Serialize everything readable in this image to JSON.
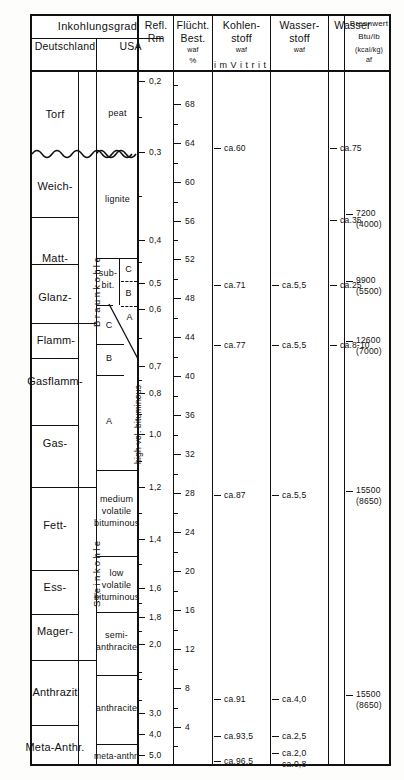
{
  "header": {
    "group_left": "Inkohlungsgrad",
    "col_germany": "Deutschland",
    "col_usa": "USA",
    "col_refl_l1": "Refl.",
    "col_refl_l2": "Rm",
    "col_vol_l1": "Flücht.",
    "col_vol_l2": "Best.",
    "col_vol_l3": "waf",
    "col_vol_l4": "%",
    "col_carbon_l1": "Kohlen-",
    "col_carbon_l2": "stoff",
    "col_carbon_l3": "waf",
    "col_hydrogen_l1": "Wasser-",
    "col_hydrogen_l2": "stoff",
    "col_hydrogen_l3": "waf",
    "col_water": "Wasser",
    "col_heat_l1": "Brennwert",
    "col_heat_l2": "Btu/lb",
    "col_heat_l3": "(kcal/kg)",
    "col_heat_l4": "af",
    "vitrit_note": "i m    V i t r i t"
  },
  "chart_data": {
    "type": "table",
    "german_ranks": [
      "Torf",
      "Weich-",
      "Matt-",
      "Glanz-",
      "Flamm-",
      "Gasflamm-",
      "Gas-",
      "Fett-",
      "Ess-",
      "Mager-",
      "Anthrazit",
      "Meta-Anthr."
    ],
    "german_groups": [
      "Braunkohle",
      "Steinkohle"
    ],
    "usa_ranks": [
      "peat",
      "lignite",
      "sub-bit.",
      "high vol. bituminous",
      "medium volatile bituminous",
      "low volatile bituminous",
      "semi-anthracite",
      "anthracite",
      "meta-anthr."
    ],
    "usa_subranks_subbit": [
      "C",
      "B",
      "A"
    ],
    "usa_subranks_hvb": [
      "C",
      "B",
      "A"
    ],
    "reflectance_label": "Refl. Rm",
    "reflectance_ticks": [
      "0,2",
      "0,3",
      "0,4",
      "0,5",
      "0,6",
      "0,7",
      "0,8",
      "1,0",
      "1,2",
      "1,4",
      "1,6",
      "1,8",
      "2,0",
      "3,0",
      "4,0",
      "5,0"
    ],
    "volatile_label": "Flücht. Best. waf %",
    "volatile_ticks": [
      "68",
      "64",
      "60",
      "56",
      "52",
      "48",
      "44",
      "40",
      "36",
      "32",
      "28",
      "24",
      "20",
      "16",
      "12",
      "8",
      "4"
    ],
    "carbon_values": [
      "ca.60",
      "ca.71",
      "ca.77",
      "ca.87",
      "ca.91",
      "ca.93,5",
      "ca.96,5"
    ],
    "hydrogen_values": [
      "ca.5,5",
      "ca.5,5",
      "ca.5,5",
      "ca.4,0",
      "ca.2,5",
      "ca.2,0",
      "ca.0,8"
    ],
    "water_values": [
      "ca.75",
      "ca.35",
      "ca.25",
      "ca.8-10"
    ],
    "heat_values": [
      "7200",
      "(4000)",
      "9900",
      "(5500)",
      "12600",
      "(7000)",
      "15500",
      "(8650)",
      "15500",
      "(8650)"
    ]
  },
  "german": {
    "r0": "Torf",
    "r1": "Weich-",
    "r2": "Matt-",
    "r3": "Glanz-",
    "r4": "Flamm-",
    "r5": "Gasflamm-",
    "r6": "Gas-",
    "r7": "Fett-",
    "r8": "Ess-",
    "r9": "Mager-",
    "r10": "Anthrazit",
    "r11": "Meta-Anthr.",
    "group_brown": "Braunkohle",
    "group_hard": "Steinkohle"
  },
  "usa": {
    "peat": "peat",
    "lignite": "lignite",
    "subbit_l1": "sub-",
    "subbit_l2": "bit.",
    "subbit_c": "C",
    "subbit_b": "B",
    "subbit_a": "A",
    "hvb_c": "C",
    "hvb_b": "B",
    "hvb_a": "A",
    "hvb_label": "high vol. bituminous",
    "mvb_l1": "medium",
    "mvb_l2": "volatile",
    "mvb_l3": "bituminous",
    "lvb_l1": "low",
    "lvb_l2": "volatile",
    "lvb_l3": "bituminous",
    "semi_l1": "semi-",
    "semi_l2": "anthracite",
    "anthracite": "anthracite",
    "meta": "meta-anthr."
  },
  "refl_scale": [
    {
      "label": "0,2",
      "y": 81
    },
    {
      "label": "0,3",
      "y": 152
    },
    {
      "label": "0,4",
      "y": 240
    },
    {
      "label": "0,5",
      "y": 283
    },
    {
      "label": "0,6",
      "y": 309
    },
    {
      "label": "0,7",
      "y": 366
    },
    {
      "label": "0,8",
      "y": 393
    }
  ],
  "refl_scale2": [
    {
      "label": "1,0",
      "y": 434
    },
    {
      "label": "1,2",
      "y": 487
    },
    {
      "label": "1,4",
      "y": 539
    },
    {
      "label": "1,6",
      "y": 588
    },
    {
      "label": "1,8",
      "y": 617
    },
    {
      "label": "2,0",
      "y": 644
    },
    {
      "label": "3,0",
      "y": 713
    },
    {
      "label": "4,0",
      "y": 734
    },
    {
      "label": "5,0",
      "y": 755
    }
  ],
  "vol_scale": [
    {
      "label": "68",
      "y": 104
    },
    {
      "label": "64",
      "y": 143
    },
    {
      "label": "60",
      "y": 182
    },
    {
      "label": "56",
      "y": 221
    },
    {
      "label": "52",
      "y": 259
    },
    {
      "label": "48",
      "y": 298
    },
    {
      "label": "44",
      "y": 337
    },
    {
      "label": "40",
      "y": 376
    },
    {
      "label": "36",
      "y": 415
    },
    {
      "label": "32",
      "y": 454
    },
    {
      "label": "28",
      "y": 493
    },
    {
      "label": "24",
      "y": 532
    },
    {
      "label": "20",
      "y": 571
    },
    {
      "label": "16",
      "y": 610
    },
    {
      "label": "12",
      "y": 649
    },
    {
      "label": "8",
      "y": 688
    },
    {
      "label": "4",
      "y": 727
    }
  ],
  "carbon": [
    {
      "label": "ca.60",
      "y": 148
    },
    {
      "label": "ca.71",
      "y": 285
    },
    {
      "label": "ca.77",
      "y": 345
    },
    {
      "label": "ca.87",
      "y": 495
    },
    {
      "label": "ca.91",
      "y": 699
    },
    {
      "label": "ca.93,5",
      "y": 736
    },
    {
      "label": "ca.96,5",
      "y": 761
    }
  ],
  "hydrogen": [
    {
      "label": "ca.5,5",
      "y": 285
    },
    {
      "label": "ca.5,5",
      "y": 345
    },
    {
      "label": "ca.5,5",
      "y": 495
    },
    {
      "label": "ca.4,0",
      "y": 699
    },
    {
      "label": "ca.2,5",
      "y": 736
    },
    {
      "label": "ca.2,0",
      "y": 753
    },
    {
      "label": "ca.0,8",
      "y": 764
    }
  ],
  "water": [
    {
      "label": "ca.75",
      "y": 148
    },
    {
      "label": "ca.35",
      "y": 220
    },
    {
      "label": "ca.25",
      "y": 285
    },
    {
      "label": "ca.8-10",
      "y": 345
    }
  ],
  "heat": [
    {
      "l1": "7200",
      "l2": "(4000)",
      "y": 214
    },
    {
      "l1": "9900",
      "l2": "(5500)",
      "y": 281
    },
    {
      "l1": "12600",
      "l2": "(7000)",
      "y": 341
    },
    {
      "l1": "15500",
      "l2": "(8650)",
      "y": 491
    },
    {
      "l1": "15500",
      "l2": "(8650)",
      "y": 695
    }
  ]
}
